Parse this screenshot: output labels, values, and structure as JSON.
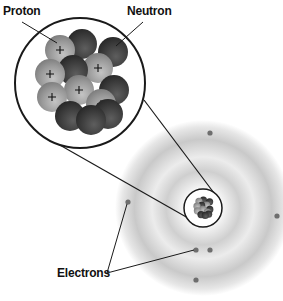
{
  "diagram": {
    "type": "atom-structure",
    "labels": {
      "proton": "Proton",
      "neutron": "Neutron",
      "electrons": "Electrons"
    },
    "nucleus_zoom": {
      "center": [
        80,
        83
      ],
      "radius": 65,
      "protons": [
        [
          60,
          50
        ],
        [
          50,
          74
        ],
        [
          98,
          68
        ],
        [
          79,
          90
        ],
        [
          52,
          97
        ],
        [
          101,
          104
        ]
      ],
      "neutrons": [
        [
          82,
          44
        ],
        [
          113,
          52
        ],
        [
          73,
          70
        ],
        [
          114,
          90
        ],
        [
          70,
          116
        ],
        [
          91,
          120
        ],
        [
          108,
          114
        ]
      ]
    },
    "atom": {
      "center": [
        203,
        208
      ],
      "nucleus_circle_radius": 19,
      "electrons": [
        [
          210,
          133
        ],
        [
          128,
          202
        ],
        [
          277,
          216
        ],
        [
          196,
          250
        ],
        [
          210,
          250
        ],
        [
          196,
          280
        ]
      ]
    },
    "colors": {
      "proton": "#9a9a9a",
      "neutron": "#3e3e3e",
      "outline": "#1a1a1a",
      "cloud": "#c8c8c8",
      "electron": "#6e6e6e"
    }
  }
}
